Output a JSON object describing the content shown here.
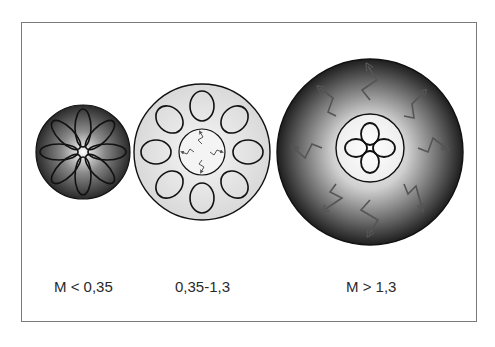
{
  "diagram": {
    "panels": [
      {
        "label": "M < 0,35",
        "description": "small dark shaded circle with eight petal-shaped circulation loops radiating from center",
        "loops": 8
      },
      {
        "label": "0,35-1,3",
        "description": "light circle with eight circulation loops around an inner circle containing four zigzag arrows",
        "loops": 8,
        "inner_zigzag_arrows": 4
      },
      {
        "label": "M > 1,3",
        "description": "large dark shaded circle with eight outward zigzag arrows around a light inner circle containing four circulation loops",
        "loops": 4,
        "outer_zigzag_arrows": 8
      }
    ],
    "colors": {
      "frame": "#7a7a7a",
      "outline": "#111111",
      "dark_fill": "#2a2a2a",
      "light_fill": "#e6e6e6",
      "zigzag": "#555555"
    }
  }
}
